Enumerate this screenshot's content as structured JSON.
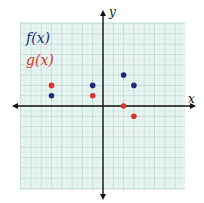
{
  "chart_data": {
    "type": "scatter",
    "title": "",
    "xlabel": "x",
    "ylabel": "y",
    "xlim": [
      -8,
      8
    ],
    "ylim": [
      -8,
      8
    ],
    "grid": true,
    "legend_position": "upper-left",
    "series": [
      {
        "name": "f(x)",
        "color": "#1f2a7a",
        "points": [
          [
            -5,
            1
          ],
          [
            -1,
            2
          ],
          [
            2,
            3
          ],
          [
            3,
            2
          ]
        ]
      },
      {
        "name": "g(x)",
        "color": "#e0302a",
        "points": [
          [
            -5,
            2
          ],
          [
            -1,
            1
          ],
          [
            2,
            0
          ],
          [
            3,
            -1
          ]
        ]
      }
    ]
  },
  "legend": {
    "f_label": "f(x)",
    "g_label": "g(x)"
  },
  "axes": {
    "x_label": "x",
    "y_label": "y"
  },
  "colors": {
    "grid_bg": "#e8f4f1",
    "grid_line": "#b8d8d0",
    "f": "#1f2a7a",
    "g": "#e0302a"
  }
}
